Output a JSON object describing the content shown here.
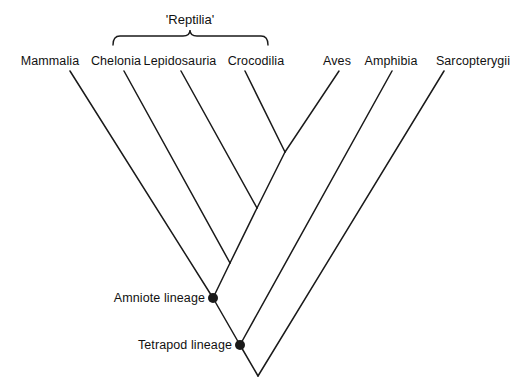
{
  "figure": {
    "type": "cladogram",
    "background_color": "#ffffff",
    "line_color": "#1a1a1a",
    "text_color": "#111111"
  },
  "group_bracket": {
    "label": "'Reptilia'",
    "label_x": 190,
    "label_y": 12,
    "left_x": 113,
    "right_x": 268,
    "peak_x": 190,
    "top_y": 36,
    "bottom_y": 45
  },
  "tips": [
    {
      "label": "Mammalia",
      "label_x": 50,
      "label_y": 55,
      "tip_x": 70,
      "tip_y": 71
    },
    {
      "label": "Chelonia",
      "label_x": 116,
      "label_y": 55,
      "tip_x": 124,
      "tip_y": 71
    },
    {
      "label": "Lepidosauria",
      "label_x": 180,
      "label_y": 55,
      "tip_x": 181,
      "tip_y": 71
    },
    {
      "label": "Crocodilia",
      "label_x": 256,
      "label_y": 55,
      "tip_x": 245,
      "tip_y": 71
    },
    {
      "label": "Aves",
      "label_x": 337,
      "label_y": 55,
      "tip_x": 339,
      "tip_y": 71
    },
    {
      "label": "Amphibia",
      "label_x": 391,
      "label_y": 55,
      "tip_x": 392,
      "tip_y": 71
    },
    {
      "label": "Sarcopterygii",
      "label_x": 473,
      "label_y": 55,
      "tip_x": 444,
      "tip_y": 71
    }
  ],
  "internal_nodes": [
    {
      "name": "archosauria-node",
      "x": 285,
      "y": 152,
      "dot": false,
      "label": ""
    },
    {
      "name": "reptilia-node",
      "x": 257,
      "y": 208,
      "dot": false,
      "label": ""
    },
    {
      "name": "diapsid-node",
      "x": 230,
      "y": 263,
      "dot": false,
      "label": ""
    },
    {
      "name": "amniote-node",
      "x": 213,
      "y": 298,
      "dot": true,
      "label": "Amniote lineage",
      "label_x": 205,
      "label_y": 298
    },
    {
      "name": "tetrapod-node",
      "x": 240,
      "y": 345,
      "dot": true,
      "label": "Tetrapod lineage",
      "label_x": 232,
      "label_y": 345
    },
    {
      "name": "root-node",
      "x": 258,
      "y": 376,
      "dot": false,
      "label": ""
    }
  ],
  "branches": [
    {
      "name": "mammalia-branch",
      "x1": 70,
      "y1": 71,
      "x2": 213,
      "y2": 298
    },
    {
      "name": "chelonia-branch",
      "x1": 124,
      "y1": 71,
      "x2": 230,
      "y2": 263
    },
    {
      "name": "lepidosauria-branch",
      "x1": 181,
      "y1": 71,
      "x2": 257,
      "y2": 208
    },
    {
      "name": "crocodilia-branch",
      "x1": 245,
      "y1": 71,
      "x2": 285,
      "y2": 152
    },
    {
      "name": "aves-branch",
      "x1": 339,
      "y1": 71,
      "x2": 285,
      "y2": 152
    },
    {
      "name": "archosauria-stem",
      "x1": 285,
      "y1": 152,
      "x2": 257,
      "y2": 208
    },
    {
      "name": "reptilia-stem",
      "x1": 257,
      "y1": 208,
      "x2": 230,
      "y2": 263
    },
    {
      "name": "diapsid-stem",
      "x1": 230,
      "y1": 263,
      "x2": 213,
      "y2": 298
    },
    {
      "name": "amniote-stem",
      "x1": 213,
      "y1": 298,
      "x2": 240,
      "y2": 345
    },
    {
      "name": "amphibia-branch",
      "x1": 392,
      "y1": 71,
      "x2": 240,
      "y2": 345
    },
    {
      "name": "tetrapod-stem",
      "x1": 240,
      "y1": 345,
      "x2": 258,
      "y2": 376
    },
    {
      "name": "sarcopterygii-branch",
      "x1": 444,
      "y1": 71,
      "x2": 258,
      "y2": 376
    }
  ]
}
